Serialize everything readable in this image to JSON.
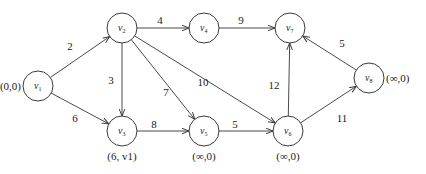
{
  "diagram": {
    "type": "directed weighted graph",
    "nodes": [
      {
        "id": "v1",
        "base": "v",
        "sub": "1",
        "x": 38,
        "y": 86,
        "label": "(0,0)",
        "label_pos": "left"
      },
      {
        "id": "v2",
        "base": "v",
        "sub": "2",
        "x": 122,
        "y": 28,
        "label": "",
        "label_pos": "none"
      },
      {
        "id": "v3",
        "base": "v",
        "sub": "3",
        "x": 122,
        "y": 131,
        "label": "(6, v1)",
        "label_pos": "below"
      },
      {
        "id": "v4",
        "base": "v",
        "sub": "4",
        "x": 204,
        "y": 28,
        "label": "",
        "label_pos": "none"
      },
      {
        "id": "v5",
        "base": "v",
        "sub": "5",
        "x": 204,
        "y": 131,
        "label": "(∞,0)",
        "label_pos": "below"
      },
      {
        "id": "v6",
        "base": "v",
        "sub": "6",
        "x": 288,
        "y": 131,
        "label": "(∞,0)",
        "label_pos": "below"
      },
      {
        "id": "v7",
        "base": "v",
        "sub": "7",
        "x": 290,
        "y": 28,
        "label": "",
        "label_pos": "none"
      },
      {
        "id": "v8",
        "base": "v",
        "sub": "8",
        "x": 369,
        "y": 78,
        "label": "(∞,0)",
        "label_pos": "right"
      }
    ],
    "edges": [
      {
        "from": "v1",
        "to": "v2",
        "weight": "2",
        "lx": 70,
        "ly": 50
      },
      {
        "from": "v1",
        "to": "v3",
        "weight": "6",
        "lx": 75,
        "ly": 122
      },
      {
        "from": "v2",
        "to": "v4",
        "weight": "4",
        "lx": 160,
        "ly": 24
      },
      {
        "from": "v2",
        "to": "v3",
        "weight": "3",
        "lx": 111,
        "ly": 84
      },
      {
        "from": "v2",
        "to": "v5",
        "weight": "7",
        "lx": 166,
        "ly": 96
      },
      {
        "from": "v2",
        "to": "v6",
        "weight": "10",
        "lx": 203,
        "ly": 86
      },
      {
        "from": "v4",
        "to": "v7",
        "weight": "9",
        "lx": 241,
        "ly": 24
      },
      {
        "from": "v3",
        "to": "v5",
        "weight": "8",
        "lx": 154,
        "ly": 128
      },
      {
        "from": "v5",
        "to": "v6",
        "weight": "5",
        "lx": 235,
        "ly": 128
      },
      {
        "from": "v6",
        "to": "v7",
        "weight": "12",
        "lx": 274,
        "ly": 89
      },
      {
        "from": "v6",
        "to": "v8",
        "weight": "11",
        "lx": 342,
        "ly": 122
      },
      {
        "from": "v8",
        "to": "v7",
        "weight": "5",
        "lx": 342,
        "ly": 47
      }
    ],
    "node_radius": 15,
    "colors": {
      "stroke": "#3a3a3a",
      "text": "#222222",
      "background": "#ffffff"
    }
  }
}
